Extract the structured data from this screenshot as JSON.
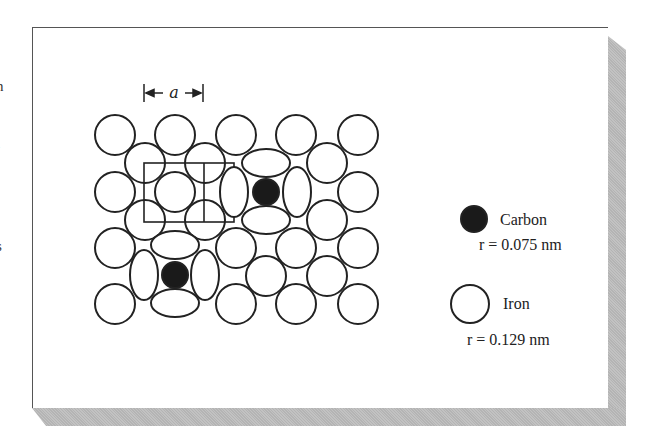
{
  "figure": {
    "lattice_label": "a",
    "edge_fragments": [
      "n",
      "l",
      "s"
    ],
    "legend": [
      {
        "name": "Carbon",
        "radius_text": "r = 0.075 nm",
        "fill": "#1a1a1a"
      },
      {
        "name": "Iron",
        "radius_text": "r = 0.129 nm",
        "fill": "#ffffff"
      }
    ],
    "colors": {
      "stroke": "#222222",
      "carbon": "#1a1a1a",
      "shadow": "#bbbbbb",
      "frame": "#555555"
    }
  }
}
